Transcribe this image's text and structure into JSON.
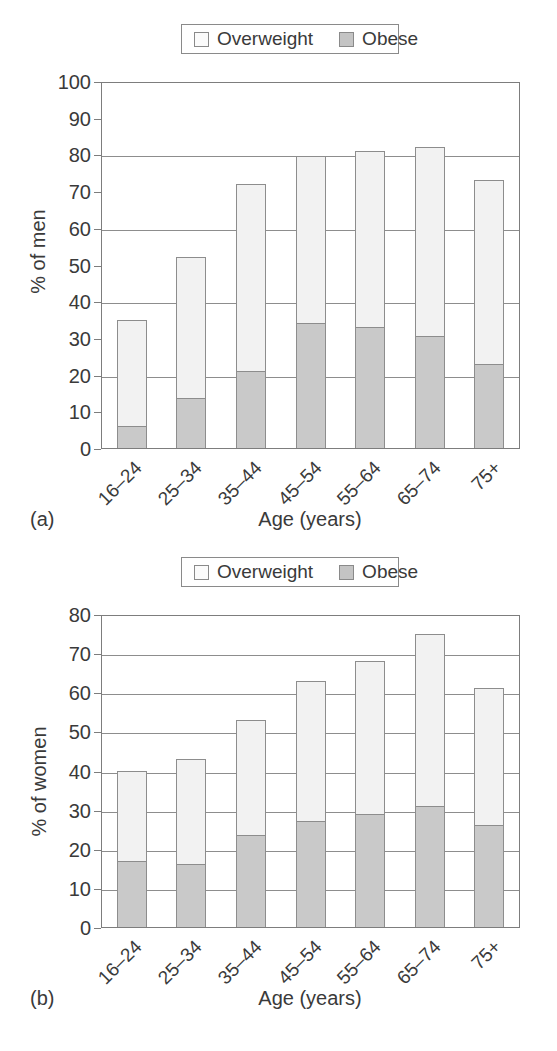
{
  "legend": {
    "overweight_label": "Overweight",
    "obese_label": "Obese",
    "overweight_color": "#f2f2f2",
    "obese_color": "#c9c9c9",
    "border_color": "#8d8d8d"
  },
  "panel_a": {
    "caption": "(a)",
    "xlabel": "Age (years)",
    "ylabel": "% of men",
    "yticks": [
      "0",
      "10",
      "20",
      "30",
      "40",
      "50",
      "60",
      "70",
      "80",
      "90",
      "100"
    ],
    "xticks": [
      "16–24",
      "25–34",
      "35–44",
      "45–54",
      "55–64",
      "65–74",
      "75+"
    ]
  },
  "panel_b": {
    "caption": "(b)",
    "xlabel": "Age (years)",
    "ylabel": "% of women",
    "yticks": [
      "0",
      "10",
      "20",
      "30",
      "40",
      "50",
      "60",
      "70",
      "80"
    ],
    "xticks": [
      "16–24",
      "25–34",
      "35–44",
      "45–54",
      "55–64",
      "65–74",
      "75+"
    ]
  },
  "chart_data": [
    {
      "type": "bar",
      "stacked": true,
      "panel": "(a)",
      "title": "",
      "xlabel": "Age (years)",
      "ylabel": "% of men",
      "ylim": [
        0,
        100
      ],
      "ytick_step": 10,
      "gridlines": [
        20,
        40,
        60,
        80
      ],
      "grid": true,
      "legend_position": "top-center",
      "categories": [
        "16–24",
        "25–34",
        "35–44",
        "45–54",
        "55–64",
        "65–74",
        "75+"
      ],
      "series": [
        {
          "name": "Obese",
          "values": [
            6,
            13.5,
            21,
            34,
            33,
            30.5,
            23
          ]
        },
        {
          "name": "Overweight",
          "values": [
            29,
            38.5,
            51,
            45.5,
            48,
            51.5,
            50
          ]
        }
      ],
      "totals": [
        35,
        52,
        72,
        79.5,
        81,
        82,
        73
      ]
    },
    {
      "type": "bar",
      "stacked": true,
      "panel": "(b)",
      "title": "",
      "xlabel": "Age (years)",
      "ylabel": "% of women",
      "ylim": [
        0,
        80
      ],
      "ytick_step": 10,
      "gridlines": [
        10,
        20,
        30,
        40,
        50,
        60,
        70
      ],
      "grid": true,
      "legend_position": "top-center",
      "categories": [
        "16–24",
        "25–34",
        "35–44",
        "45–54",
        "55–64",
        "65–74",
        "75+"
      ],
      "series": [
        {
          "name": "Obese",
          "values": [
            17,
            16,
            23.5,
            27,
            29,
            31,
            26
          ]
        },
        {
          "name": "Overweight",
          "values": [
            23,
            27,
            29.5,
            36,
            39,
            44,
            35
          ]
        }
      ],
      "totals": [
        40,
        43,
        53,
        63,
        68,
        75,
        61
      ]
    }
  ]
}
